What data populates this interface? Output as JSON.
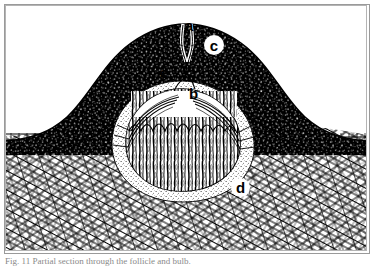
{
  "figure": {
    "kind": "line-drawing",
    "frame_color": "#9a9a9a",
    "ink_color": "#000000",
    "paper_color": "#ffffff",
    "labels": [
      {
        "id": "a",
        "text": "a",
        "style": "plain",
        "note": "follicular opening / pore at the crest of the dark mound"
      },
      {
        "id": "c",
        "text": "c",
        "style": "bubble",
        "note": "dark stippled outer layer of the mound"
      },
      {
        "id": "e",
        "text": "e",
        "style": "plain",
        "note": "sheath at the upper margin of the bulb"
      },
      {
        "id": "b",
        "text": "b",
        "style": "plain",
        "note": "pale bulb interior"
      },
      {
        "id": "d",
        "text": "d",
        "style": "bubble",
        "note": "dense fibrous tissue surrounding the bulb"
      }
    ]
  },
  "caption": {
    "prefix": "Fig. 11",
    "text": "Fig. 11  Partial section through the follicle and bulb.",
    "clipped": true
  }
}
